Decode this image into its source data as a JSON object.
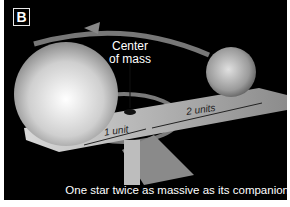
{
  "panel": {
    "badge": "B",
    "center_of_mass_label_line1": "Center",
    "center_of_mass_label_line2": "of mass",
    "distance_large": "1 unit",
    "distance_small": "2 units",
    "caption": "One star twice as massive as its companion"
  },
  "colors": {
    "background": "#000000",
    "border": "#ffffff",
    "text": "#ffffff",
    "star": "#d9d9d9",
    "beam": "#a8a8a8"
  }
}
